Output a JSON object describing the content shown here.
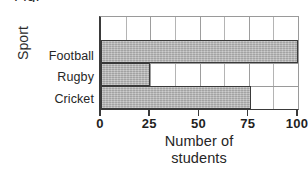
{
  "figure": {
    "caption_fragment": "Fig."
  },
  "chart_data": {
    "type": "bar",
    "orientation": "horizontal",
    "title": "",
    "xlabel_line1": "Number of",
    "xlabel_line2": "students",
    "ylabel": "Sport",
    "categories": [
      "Football",
      "Rugby",
      "Cricket"
    ],
    "values": [
      100,
      25,
      76
    ],
    "xlim": [
      0,
      100
    ],
    "xticks": [
      0,
      25,
      50,
      75,
      100
    ],
    "xtick_labels": [
      "0",
      "25",
      "50",
      "75",
      "100"
    ],
    "minor_gridline_step": 12.5,
    "minor_gridlines": [
      0,
      12.5,
      25,
      37.5,
      50,
      62.5,
      75,
      87.5,
      100
    ],
    "grid": true,
    "legend": false,
    "bar_fill_color": "#b6b6b6",
    "bar_edge_color": "#3a3a3a",
    "axis_color": "#3a3a3a",
    "gridline_color": "#b4b4b4",
    "empty_top_row": true
  }
}
